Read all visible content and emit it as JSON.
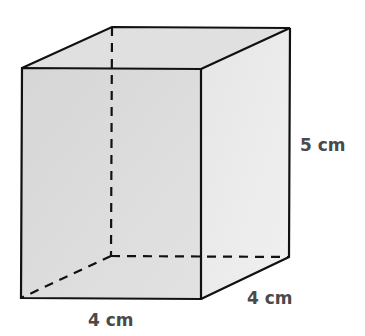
{
  "figure": {
    "shape": "rectangular prism",
    "labels": {
      "width": "4 cm",
      "depth": "4 cm",
      "height": "5 cm"
    },
    "colors": {
      "front_face": "#dadada",
      "top_face": "#e0e0e0",
      "right_face": "#ebebeb",
      "edge": "#111111",
      "label": "#4a4a4a"
    }
  }
}
